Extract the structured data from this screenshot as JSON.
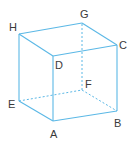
{
  "diagram": {
    "type": "cube",
    "line_color": "#5bb8e6",
    "label_color": "#3a3a3a",
    "vertices": {
      "A": {
        "x": 53,
        "y": 121,
        "label": "A",
        "lx": 50,
        "ly": 138
      },
      "B": {
        "x": 117,
        "y": 111,
        "label": "B",
        "lx": 114,
        "ly": 127
      },
      "C": {
        "x": 117,
        "y": 45,
        "label": "C",
        "lx": 119,
        "ly": 49
      },
      "D": {
        "x": 53,
        "y": 56,
        "label": "D",
        "lx": 55,
        "ly": 69
      },
      "E": {
        "x": 19,
        "y": 101,
        "label": "E",
        "lx": 8,
        "ly": 108
      },
      "F": {
        "x": 82,
        "y": 90,
        "label": "F",
        "lx": 85,
        "ly": 88
      },
      "G": {
        "x": 82,
        "y": 23,
        "label": "G",
        "lx": 80,
        "ly": 18
      },
      "H": {
        "x": 19,
        "y": 34,
        "label": "H",
        "lx": 9,
        "ly": 31
      }
    },
    "visible_edges": [
      [
        "A",
        "B"
      ],
      [
        "B",
        "C"
      ],
      [
        "C",
        "D"
      ],
      [
        "D",
        "A"
      ],
      [
        "H",
        "D"
      ],
      [
        "H",
        "G"
      ],
      [
        "G",
        "C"
      ],
      [
        "H",
        "E"
      ],
      [
        "E",
        "A"
      ]
    ],
    "hidden_edges": [
      [
        "E",
        "F"
      ],
      [
        "F",
        "B"
      ],
      [
        "F",
        "G"
      ]
    ]
  }
}
